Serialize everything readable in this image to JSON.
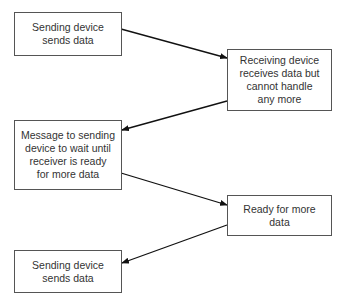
{
  "diagram": {
    "type": "flowchart",
    "nodes": [
      {
        "id": "n1",
        "label": "Sending device\nsends data"
      },
      {
        "id": "n2",
        "label": "Receiving device\nreceives data but\ncannot handle\nany more"
      },
      {
        "id": "n3",
        "label": "Message to sending\ndevice to wait until\nreceiver is ready\nfor more data"
      },
      {
        "id": "n4",
        "label": "Ready for more\ndata"
      },
      {
        "id": "n5",
        "label": "Sending device\nsends data"
      }
    ],
    "edges": [
      {
        "from": "n1",
        "to": "n2"
      },
      {
        "from": "n2",
        "to": "n3"
      },
      {
        "from": "n3",
        "to": "n4"
      },
      {
        "from": "n4",
        "to": "n5"
      }
    ]
  }
}
